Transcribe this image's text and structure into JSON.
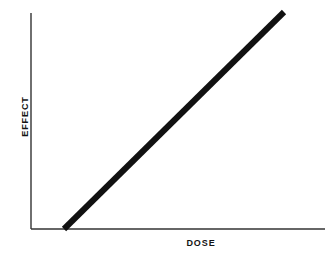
{
  "chart_data": {
    "type": "line",
    "title": "",
    "subtitle": "",
    "xlabel": "DOSE",
    "ylabel": "EFFECT",
    "x": [
      0.15,
      1.0
    ],
    "y": [
      0.0,
      1.0
    ],
    "series": [
      {
        "name": "dose-response",
        "x": [
          0.15,
          1.0
        ],
        "y": [
          0.0,
          1.0
        ],
        "color": "#111111",
        "line_width_px": 6,
        "style": "solid"
      }
    ],
    "xlim": [
      0,
      1
    ],
    "ylim": [
      0,
      1
    ],
    "xticks": [],
    "yticks": [],
    "xticklabels": [],
    "yticklabels": [],
    "grid": false,
    "legend": false,
    "legend_position": "none",
    "annotations": []
  },
  "axes": {
    "x_axis_name": "x-axis-line",
    "y_axis_name": "y-axis-line",
    "axis_color": "#333333",
    "axis_width_px": 1.4,
    "origin": {
      "x": 31,
      "y": 229
    },
    "x_end": {
      "x": 325,
      "y": 229
    },
    "y_end": {
      "x": 31,
      "y": 13
    }
  },
  "line_geometry": {
    "start": {
      "x": 64,
      "y": 229
    },
    "end": {
      "x": 284,
      "y": 12
    },
    "color": "#111111",
    "width_px": 6
  },
  "canvas": {
    "width": 335,
    "height": 257,
    "background": "#ffffff"
  }
}
